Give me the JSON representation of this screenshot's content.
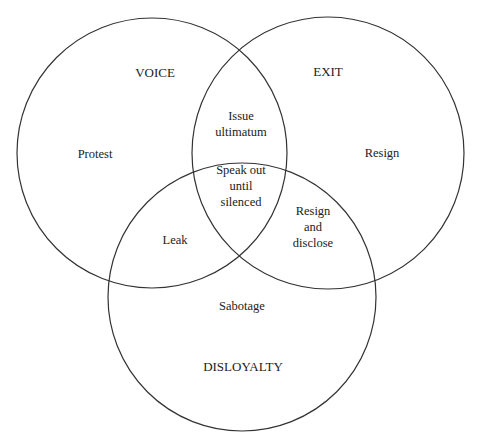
{
  "diagram": {
    "type": "venn",
    "sets": [
      {
        "id": "voice",
        "label": "VOICE",
        "cx": 152,
        "cy": 153,
        "r": 135,
        "label_x": 155,
        "label_y": 77
      },
      {
        "id": "exit",
        "label": "EXIT",
        "cx": 328,
        "cy": 153,
        "r": 136,
        "label_x": 328,
        "label_y": 76
      },
      {
        "id": "disloyalty",
        "label": "DISLOYALTY",
        "cx": 242,
        "cy": 297,
        "r": 134,
        "label_x": 243,
        "label_y": 371
      }
    ],
    "regions": [
      {
        "id": "voice-only",
        "sets": [
          "voice"
        ],
        "lines": [
          "Protest"
        ],
        "x": 95,
        "y": 154
      },
      {
        "id": "exit-only",
        "sets": [
          "exit"
        ],
        "lines": [
          "Resign"
        ],
        "x": 382,
        "y": 153
      },
      {
        "id": "voice-exit",
        "sets": [
          "voice",
          "exit"
        ],
        "lines": [
          "Issue",
          "ultimatum"
        ],
        "x": 241,
        "y": 124
      },
      {
        "id": "voice-exit-disloyalty",
        "sets": [
          "voice",
          "exit",
          "disloyalty"
        ],
        "lines": [
          "Speak out",
          "until",
          "silenced"
        ],
        "x": 241,
        "y": 186
      },
      {
        "id": "voice-disloyalty",
        "sets": [
          "voice",
          "disloyalty"
        ],
        "lines": [
          "Leak"
        ],
        "x": 175,
        "y": 240
      },
      {
        "id": "exit-disloyalty",
        "sets": [
          "exit",
          "disloyalty"
        ],
        "lines": [
          "Resign",
          "and",
          "disclose"
        ],
        "x": 313,
        "y": 227
      },
      {
        "id": "disloyalty-only",
        "sets": [
          "disloyalty"
        ],
        "lines": [
          "Sabotage"
        ],
        "x": 242,
        "y": 306
      }
    ],
    "colors": {
      "stroke": "#333333",
      "text": "#222222",
      "background": "#ffffff"
    }
  }
}
